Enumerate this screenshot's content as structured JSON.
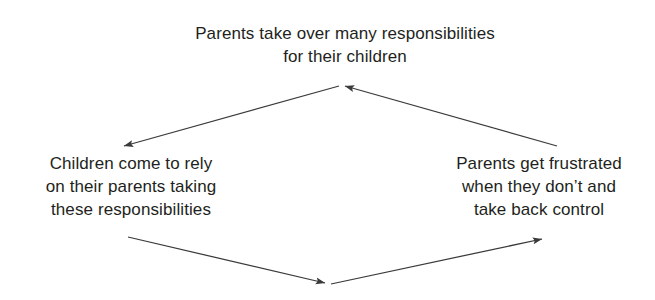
{
  "diagram": {
    "type": "cycle",
    "title": "",
    "background_color": "#ffffff",
    "text_color": "#231f20",
    "arrow_color": "#3a3a3a",
    "nodes": [
      {
        "id": "parents-take-over",
        "position": "top",
        "lines": [
          "Parents take over many responsibilities",
          "for their children"
        ]
      },
      {
        "id": "children-rely",
        "position": "left",
        "lines": [
          "Children come to rely",
          "on their parents taking",
          "these responsibilities"
        ]
      },
      {
        "id": "parents-frustrated",
        "position": "right",
        "lines": [
          "Parents get frustrated",
          "when they don’t and",
          "take back control"
        ]
      }
    ],
    "arrows": [
      {
        "id": "top-to-left",
        "from": "parents-take-over",
        "to": "children-rely",
        "direction": "down-left"
      },
      {
        "id": "left-to-bottom",
        "from": "children-rely",
        "to": "bottom-apex",
        "direction": "down-right"
      },
      {
        "id": "bottom-to-right",
        "from": "bottom-apex",
        "to": "parents-frustrated",
        "direction": "up-right"
      },
      {
        "id": "right-to-top",
        "from": "parents-frustrated",
        "to": "parents-take-over",
        "direction": "up-left"
      }
    ]
  }
}
